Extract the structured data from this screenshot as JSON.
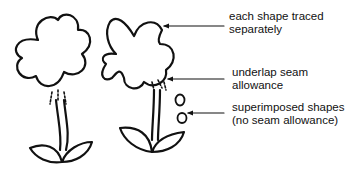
{
  "diagram": {
    "labels": {
      "traced": {
        "line1": "each shape traced",
        "line2": "separately"
      },
      "underlap": {
        "line1": "underlap seam",
        "line2": "allowance"
      },
      "superimposed": {
        "line1": "superimposed shapes",
        "line2": "(no seam allowance)"
      }
    },
    "figures": [
      {
        "name": "left-flower",
        "description": "flower with underlap seam marks between head and stem"
      },
      {
        "name": "right-flower",
        "description": "flower with separately traced shapes and superimposed small circles"
      }
    ],
    "colors": {
      "ink": "#111111",
      "background": "#ffffff"
    }
  }
}
